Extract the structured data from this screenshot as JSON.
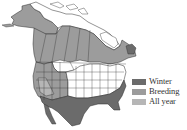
{
  "map": {
    "subject": "North America range map",
    "colors": {
      "winter": "#6b6b6b",
      "breeding": "#9c9c9c",
      "all_year": "#b6b6b6",
      "outside_range": "#ffffff",
      "borders": "#2a2a2a"
    }
  },
  "legend": {
    "items": [
      {
        "key": "winter",
        "label": "Winter",
        "color": "#6b6b6b"
      },
      {
        "key": "breeding",
        "label": "Breeding",
        "color": "#9c9c9c"
      },
      {
        "key": "all_year",
        "label": "All year",
        "color": "#b6b6b6"
      }
    ]
  }
}
